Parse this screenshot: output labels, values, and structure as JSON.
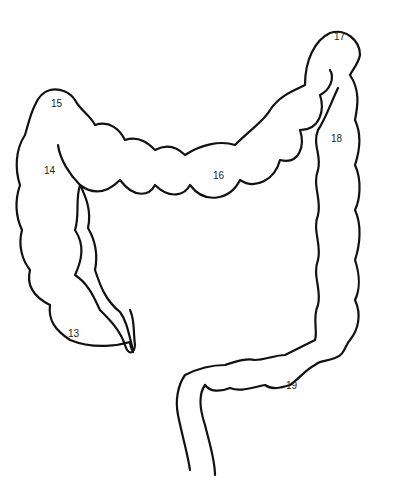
{
  "diagram": {
    "labels": [
      {
        "id": "13",
        "text": "13",
        "x": 68,
        "y": 328
      },
      {
        "id": "14",
        "text": "14",
        "x": 44,
        "y": 165
      },
      {
        "id": "15",
        "text": "15",
        "x": 51,
        "y": 98
      },
      {
        "id": "16",
        "text": "16",
        "x": 213,
        "y": 170
      },
      {
        "id": "17",
        "text": "17",
        "x": 334,
        "y": 31
      },
      {
        "id": "18",
        "text": "18",
        "x": 331,
        "y": 133
      },
      {
        "id": "19",
        "text": "19",
        "x": 286,
        "y": 380
      }
    ]
  }
}
